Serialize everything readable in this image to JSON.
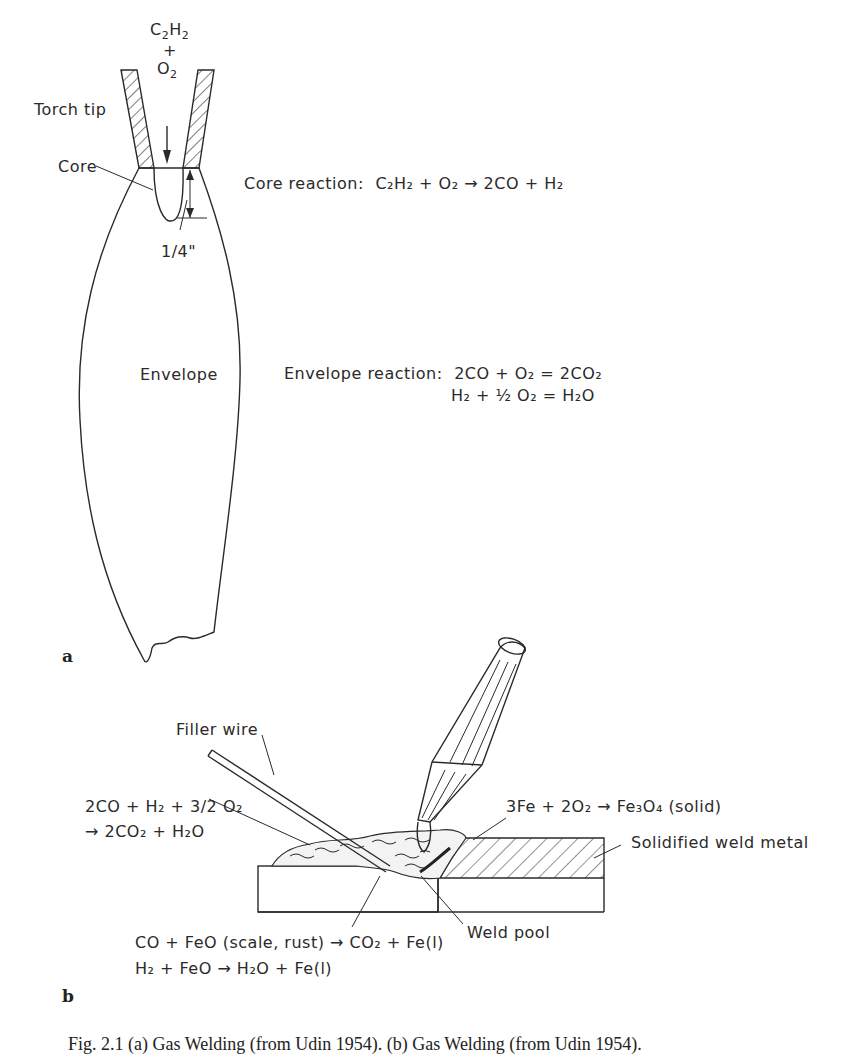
{
  "figure": {
    "panel_a": {
      "label": "a",
      "gas_in": {
        "c2h2_main": "C",
        "c2h2_sub1": "2",
        "c2h2_h": "H",
        "c2h2_sub2": "2",
        "plus": "+",
        "o2_main": "O",
        "o2_sub": "2"
      },
      "torch_tip_label": "Torch tip",
      "core_label": "Core",
      "dimension_label": "1/4\"",
      "envelope_label": "Envelope",
      "core_reaction": {
        "prefix": "Core reaction:",
        "equation": "C₂H₂ + O₂ → 2CO + H₂"
      },
      "envelope_reaction": {
        "prefix": "Envelope reaction:",
        "line1": "2CO + O₂ = 2CO₂",
        "line2": "H₂ + ½ O₂ = H₂O"
      }
    },
    "panel_b": {
      "label": "b",
      "filler_wire_label": "Filler wire",
      "left_reaction": {
        "line1": "2CO + H₂ + 3/2 O₂",
        "line2": "→ 2CO₂ + H₂O"
      },
      "oxide_reaction": "3Fe + 2O₂ → Fe₃O₄ (solid)",
      "solidified_label": "Solidified weld metal",
      "weld_pool_label": "Weld pool",
      "bottom_reactions": {
        "line1": "CO + FeO (scale, rust) → CO₂ + Fe(l)",
        "line2": "H₂ + FeO → H₂O + Fe(l)"
      }
    },
    "caption": "Fig. 2.1 (a) Gas Welding (from Udin 1954). (b) Gas Welding (from Udin 1954)."
  }
}
